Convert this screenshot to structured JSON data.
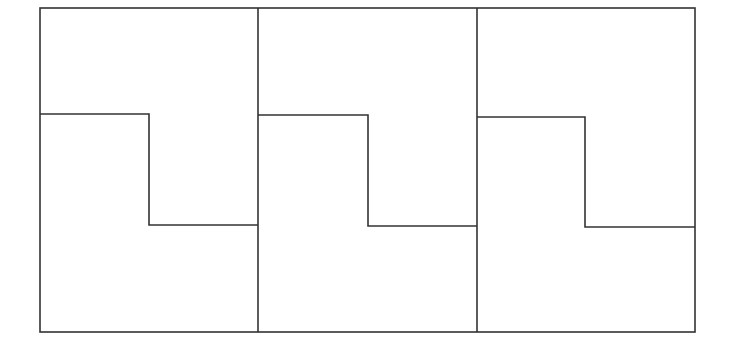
{
  "diagram": {
    "stroke_color": "#333333",
    "background": "#ffffff",
    "outer": {
      "x1": 40,
      "y1": 8,
      "x2": 695,
      "y2": 332
    },
    "dividers": [
      258,
      477
    ],
    "panels": [
      {
        "left": 40,
        "right": 258,
        "step_top_y": 114,
        "step_x": 149,
        "step_bottom_y": 225
      },
      {
        "left": 258,
        "right": 477,
        "step_top_y": 115,
        "step_x": 368,
        "step_bottom_y": 226
      },
      {
        "left": 477,
        "right": 695,
        "step_top_y": 117,
        "step_x": 585,
        "step_bottom_y": 227
      }
    ]
  }
}
